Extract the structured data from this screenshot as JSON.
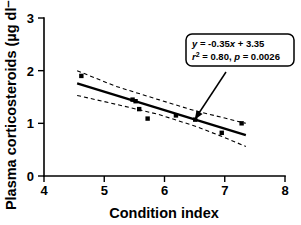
{
  "chart_data": {
    "type": "scatter",
    "title": "",
    "xlabel": "Condition index",
    "ylabel": "Plasma corticosteroids (µg dl⁻¹)",
    "xlim": [
      4,
      8
    ],
    "ylim": [
      0,
      3
    ],
    "xticks": [
      "4",
      "5",
      "6",
      "7",
      "8"
    ],
    "yticks": [
      "0",
      "1",
      "2",
      "3"
    ],
    "grid": false,
    "legend": "none",
    "points": [
      {
        "x": 4.62,
        "y": 1.9
      },
      {
        "x": 5.47,
        "y": 1.45
      },
      {
        "x": 5.52,
        "y": 1.42
      },
      {
        "x": 5.58,
        "y": 1.27
      },
      {
        "x": 5.72,
        "y": 1.09
      },
      {
        "x": 6.19,
        "y": 1.15
      },
      {
        "x": 6.51,
        "y": 1.07
      },
      {
        "x": 6.95,
        "y": 0.82
      },
      {
        "x": 7.28,
        "y": 1.0
      }
    ],
    "series": [
      {
        "name": "Plasma corticosteroids",
        "x": [
          4.62,
          5.47,
          5.52,
          5.58,
          5.72,
          6.19,
          6.51,
          6.95,
          7.28
        ],
        "values": [
          1.9,
          1.45,
          1.42,
          1.27,
          1.09,
          1.15,
          1.07,
          0.82,
          1.0
        ]
      }
    ],
    "fit": {
      "type": "linear-regression",
      "slope": -0.35,
      "intercept": 3.35,
      "r_squared": 0.8,
      "p_value": 0.0026,
      "x_start": 4.55,
      "x_end": 7.35,
      "y_start": 1.76,
      "y_end": 0.78
    },
    "confidence_band": {
      "label": "95% confidence interval",
      "style": "dashed",
      "upper": [
        {
          "x": 4.55,
          "y": 2.0
        },
        {
          "x": 5.2,
          "y": 1.7
        },
        {
          "x": 5.9,
          "y": 1.45
        },
        {
          "x": 6.5,
          "y": 1.24
        },
        {
          "x": 7.0,
          "y": 1.1
        },
        {
          "x": 7.35,
          "y": 1.0
        }
      ],
      "lower": [
        {
          "x": 4.55,
          "y": 1.53
        },
        {
          "x": 5.2,
          "y": 1.36
        },
        {
          "x": 5.9,
          "y": 1.17
        },
        {
          "x": 6.5,
          "y": 0.95
        },
        {
          "x": 7.0,
          "y": 0.73
        },
        {
          "x": 7.35,
          "y": 0.56
        }
      ]
    },
    "annotation": {
      "line1_prefix_italic": "y",
      "line1": "y = -0.35x + 3.35",
      "line1_part_a": " = -0.35",
      "line1_part_b": "x",
      "line1_part_c": " + 3.35",
      "line2": "r² = 0.80, p = 0.0026",
      "line2_r": "r",
      "line2_sup": "2",
      "line2_mid": " = 0.80, ",
      "line2_p": "p",
      "line2_end": " = 0.0026",
      "points_to": {
        "x": 6.5,
        "y": 1.07
      }
    },
    "colors": {
      "axis": "#000000",
      "marker": "#000000",
      "regression": "#000000",
      "confidence": "#000000",
      "background": "#ffffff"
    }
  }
}
